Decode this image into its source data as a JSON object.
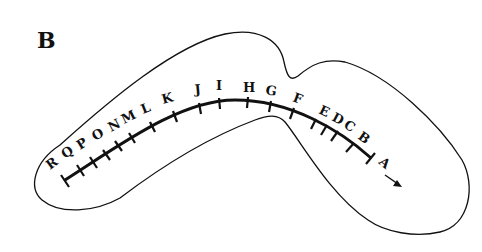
{
  "panel": {
    "label": "B"
  },
  "colors": {
    "ink": "#111111",
    "background": "#ffffff"
  },
  "markers": [
    {
      "label": "A",
      "x": 378,
      "y": 163,
      "rot": 40
    },
    {
      "label": "B",
      "x": 357,
      "y": 138,
      "rot": 36
    },
    {
      "label": "C",
      "x": 343,
      "y": 127,
      "rot": 32
    },
    {
      "label": "D",
      "x": 331,
      "y": 120,
      "rot": 28
    },
    {
      "label": "E",
      "x": 318,
      "y": 113,
      "rot": 25
    },
    {
      "label": "F",
      "x": 297,
      "y": 104,
      "rot": 20
    },
    {
      "label": "G",
      "x": 272,
      "y": 95,
      "rot": 10
    },
    {
      "label": "H",
      "x": 250,
      "y": 92,
      "rot": 0
    },
    {
      "label": "I",
      "x": 218,
      "y": 91,
      "rot": 0
    },
    {
      "label": "J",
      "x": 199,
      "y": 95,
      "rot": -5
    },
    {
      "label": "K",
      "x": 170,
      "y": 103,
      "rot": -15
    },
    {
      "label": "L",
      "x": 147,
      "y": 113,
      "rot": -22
    },
    {
      "label": "M",
      "x": 131,
      "y": 121,
      "rot": -26
    },
    {
      "label": "N",
      "x": 115,
      "y": 129,
      "rot": -28
    },
    {
      "label": "O",
      "x": 98,
      "y": 139,
      "rot": -30
    },
    {
      "label": "P",
      "x": 82,
      "y": 149,
      "rot": -32
    },
    {
      "label": "Q",
      "x": 67,
      "y": 158,
      "rot": -34
    },
    {
      "label": "R",
      "x": 51,
      "y": 170,
      "rot": -36
    }
  ],
  "direction_arrow": {
    "icon": "arrow-down-right-icon"
  }
}
